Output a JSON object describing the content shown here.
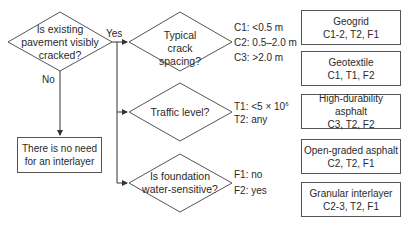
{
  "decisions": [
    {
      "id": "d1",
      "text": "Is existing pavement visibly cracked?"
    },
    {
      "id": "d2",
      "text": "Typical crack spacing?"
    },
    {
      "id": "d3",
      "text": "Traffic level?"
    },
    {
      "id": "d4",
      "text": "Is foundation water-sensitive?"
    }
  ],
  "edge_labels": {
    "yes": "Yes",
    "no": "No"
  },
  "d1_lines": [
    "Is existing",
    "pavement visibly",
    "cracked?"
  ],
  "d4_lines": [
    "Is foundation",
    "water-sensitive?"
  ],
  "criteria": {
    "crack": [
      "C1: <0.5 m",
      "C2: 0.5–2.0 m",
      "C3: >2.0 m"
    ],
    "traffic": {
      "t1_prefix": "T1: <5 × 10",
      "t1_exp": "6",
      "t2": "T2: any"
    },
    "foundation": [
      "F1: no",
      "F2: yes"
    ]
  },
  "no_result": [
    "There is no need",
    "for an interlayer"
  ],
  "options": [
    {
      "name": "Geogrid",
      "codes": "C1-2, T2, F1"
    },
    {
      "name": "Geotextile",
      "codes": "C1, T1, F2"
    },
    {
      "name": "High-durability asphalt",
      "codes": "C3, T2, F2"
    },
    {
      "name": "Open-graded asphalt",
      "codes": "C2, T2, F1"
    },
    {
      "name": "Granular interlayer",
      "codes": "C2-3, T2, F1"
    }
  ]
}
